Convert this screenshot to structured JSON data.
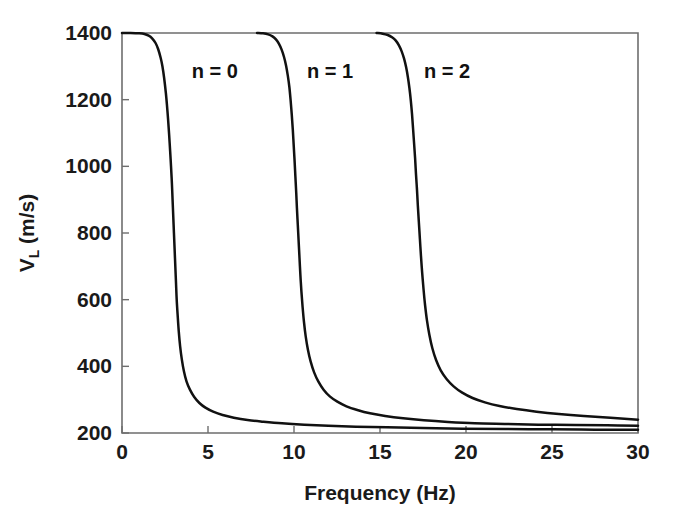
{
  "chart_data": {
    "type": "line",
    "title": "",
    "subtitle": "",
    "xlabel": "Frequency (Hz)",
    "ylabel": "V_L (m/s)",
    "ylabel_main": "V",
    "ylabel_sub": "L",
    "ylabel_unit": " (m/s)",
    "xlim": [
      0,
      30
    ],
    "ylim": [
      200,
      1400
    ],
    "xticks": [
      0,
      5,
      10,
      15,
      20,
      25,
      30
    ],
    "yticks": [
      200,
      400,
      600,
      800,
      1000,
      1200,
      1400
    ],
    "xtick_labels": [
      "0",
      "5",
      "10",
      "15",
      "20",
      "25",
      "30"
    ],
    "ytick_labels": [
      "200",
      "400",
      "600",
      "800",
      "1000",
      "1200",
      "1400"
    ],
    "grid": false,
    "legend_position": "inline-annotation",
    "line_color": "#111111",
    "axis_color": "#6e6e6e",
    "background_color": "#ffffff",
    "annotations": [
      {
        "text": "n = 0",
        "x": 5.4,
        "y": 1285
      },
      {
        "text": "n = 1",
        "x": 12.1,
        "y": 1285
      },
      {
        "text": "n = 2",
        "x": 18.9,
        "y": 1285
      }
    ],
    "series": [
      {
        "name": "n = 0",
        "cutoff_frequency": 2.9,
        "asymptote": 210,
        "points": [
          [
            0.0,
            1400
          ],
          [
            0.5,
            1400
          ],
          [
            1.0,
            1399
          ],
          [
            1.3,
            1397
          ],
          [
            1.55,
            1392
          ],
          [
            1.75,
            1384
          ],
          [
            1.95,
            1370
          ],
          [
            2.1,
            1352
          ],
          [
            2.25,
            1325
          ],
          [
            2.35,
            1300
          ],
          [
            2.45,
            1265
          ],
          [
            2.55,
            1220
          ],
          [
            2.62,
            1180
          ],
          [
            2.68,
            1140
          ],
          [
            2.74,
            1095
          ],
          [
            2.8,
            1045
          ],
          [
            2.85,
            1000
          ],
          [
            2.9,
            950
          ],
          [
            2.94,
            900
          ],
          [
            2.98,
            850
          ],
          [
            3.02,
            800
          ],
          [
            3.06,
            750
          ],
          [
            3.1,
            700
          ],
          [
            3.14,
            650
          ],
          [
            3.18,
            600
          ],
          [
            3.24,
            550
          ],
          [
            3.3,
            505
          ],
          [
            3.38,
            460
          ],
          [
            3.48,
            420
          ],
          [
            3.6,
            385
          ],
          [
            3.75,
            355
          ],
          [
            3.95,
            330
          ],
          [
            4.2,
            308
          ],
          [
            4.5,
            290
          ],
          [
            4.85,
            276
          ],
          [
            5.3,
            264
          ],
          [
            5.85,
            254
          ],
          [
            6.5,
            246
          ],
          [
            7.3,
            239
          ],
          [
            8.2,
            234
          ],
          [
            9.3,
            229
          ],
          [
            10.6,
            225
          ],
          [
            12.0,
            222
          ],
          [
            13.6,
            219
          ],
          [
            15.4,
            217
          ],
          [
            17.5,
            215
          ],
          [
            19.8,
            213
          ],
          [
            22.3,
            212
          ],
          [
            25.0,
            211
          ],
          [
            27.5,
            210
          ],
          [
            30.0,
            210
          ]
        ]
      },
      {
        "name": "n = 1",
        "cutoff_frequency": 9.8,
        "asymptote": 222,
        "points": [
          [
            7.85,
            1400
          ],
          [
            8.2,
            1399
          ],
          [
            8.5,
            1396
          ],
          [
            8.75,
            1390
          ],
          [
            8.95,
            1381
          ],
          [
            9.12,
            1368
          ],
          [
            9.28,
            1350
          ],
          [
            9.42,
            1328
          ],
          [
            9.54,
            1302
          ],
          [
            9.64,
            1272
          ],
          [
            9.73,
            1238
          ],
          [
            9.8,
            1200
          ],
          [
            9.87,
            1155
          ],
          [
            9.93,
            1110
          ],
          [
            9.98,
            1065
          ],
          [
            10.03,
            1020
          ],
          [
            10.08,
            970
          ],
          [
            10.13,
            920
          ],
          [
            10.17,
            875
          ],
          [
            10.22,
            825
          ],
          [
            10.27,
            775
          ],
          [
            10.32,
            725
          ],
          [
            10.37,
            675
          ],
          [
            10.43,
            625
          ],
          [
            10.5,
            578
          ],
          [
            10.58,
            533
          ],
          [
            10.68,
            490
          ],
          [
            10.81,
            450
          ],
          [
            10.97,
            414
          ],
          [
            11.17,
            382
          ],
          [
            11.42,
            354
          ],
          [
            11.72,
            330
          ],
          [
            12.08,
            310
          ],
          [
            12.52,
            294
          ],
          [
            13.05,
            280
          ],
          [
            13.68,
            269
          ],
          [
            14.42,
            259
          ],
          [
            15.3,
            251
          ],
          [
            16.35,
            244
          ],
          [
            17.55,
            238
          ],
          [
            18.95,
            233
          ],
          [
            20.5,
            229
          ],
          [
            22.25,
            227
          ],
          [
            24.2,
            225
          ],
          [
            26.3,
            224
          ],
          [
            28.2,
            223
          ],
          [
            30.0,
            222
          ]
        ]
      },
      {
        "name": "n = 2",
        "cutoff_frequency": 16.7,
        "asymptote": 240,
        "points": [
          [
            14.8,
            1400
          ],
          [
            15.15,
            1398
          ],
          [
            15.45,
            1394
          ],
          [
            15.7,
            1387
          ],
          [
            15.92,
            1377
          ],
          [
            16.1,
            1363
          ],
          [
            16.26,
            1345
          ],
          [
            16.4,
            1323
          ],
          [
            16.52,
            1297
          ],
          [
            16.62,
            1268
          ],
          [
            16.71,
            1235
          ],
          [
            16.79,
            1198
          ],
          [
            16.86,
            1158
          ],
          [
            16.92,
            1115
          ],
          [
            16.98,
            1070
          ],
          [
            17.04,
            1025
          ],
          [
            17.09,
            978
          ],
          [
            17.15,
            930
          ],
          [
            17.2,
            882
          ],
          [
            17.26,
            832
          ],
          [
            17.32,
            782
          ],
          [
            17.38,
            732
          ],
          [
            17.45,
            682
          ],
          [
            17.53,
            632
          ],
          [
            17.62,
            584
          ],
          [
            17.73,
            538
          ],
          [
            17.87,
            495
          ],
          [
            18.04,
            455
          ],
          [
            18.26,
            419
          ],
          [
            18.53,
            388
          ],
          [
            18.87,
            362
          ],
          [
            19.28,
            340
          ],
          [
            19.78,
            321
          ],
          [
            20.38,
            305
          ],
          [
            21.1,
            292
          ],
          [
            21.95,
            281
          ],
          [
            22.95,
            272
          ],
          [
            24.1,
            264
          ],
          [
            25.4,
            257
          ],
          [
            26.85,
            251
          ],
          [
            28.4,
            246
          ],
          [
            30.0,
            240
          ]
        ]
      }
    ]
  },
  "plot_geometry": {
    "left": 122,
    "right": 638,
    "top": 33,
    "bottom": 433
  }
}
